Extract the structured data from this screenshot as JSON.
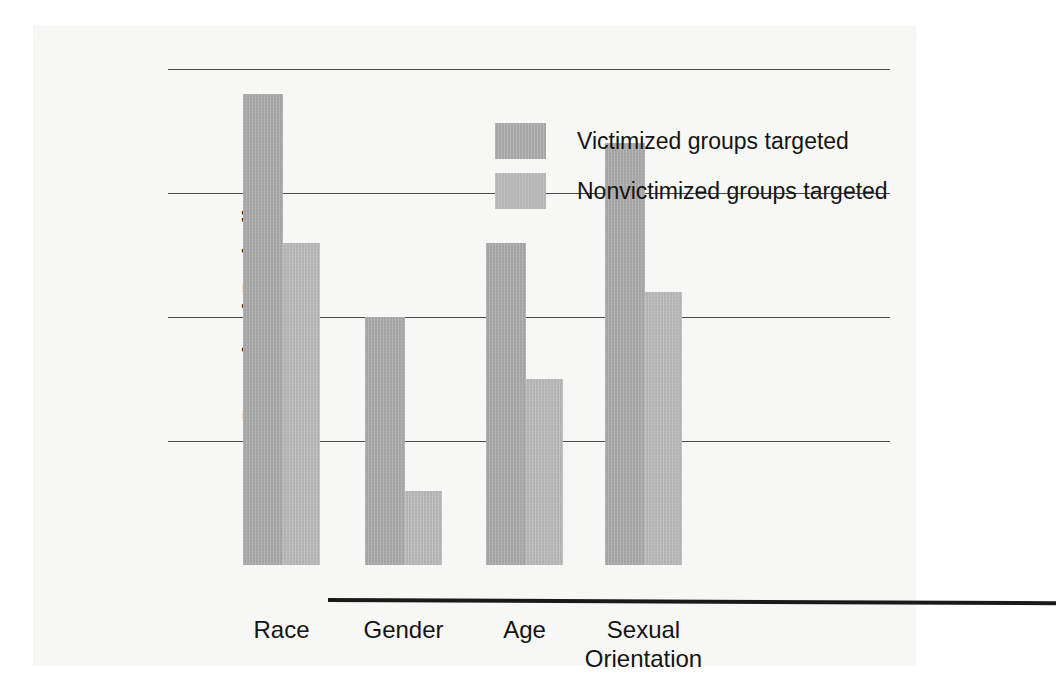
{
  "chart_data": {
    "type": "bar",
    "title": "",
    "xlabel": "",
    "ylabel": "Perceived Prejudice",
    "categories": [
      "Race",
      "Gender",
      "Age",
      "Sexual Orientation"
    ],
    "category_lines": [
      [
        "Race"
      ],
      [
        "Gender"
      ],
      [
        "Age"
      ],
      [
        "Sexual",
        "Orientation"
      ]
    ],
    "series": [
      {
        "name": "Victimized groups targeted",
        "color": "#a7a7a7",
        "values": [
          6.8,
          5.0,
          5.6,
          6.4
        ]
      },
      {
        "name": "Nonvictimized groups targeted",
        "color": "#b6b6b6",
        "values": [
          5.6,
          3.6,
          4.5,
          5.2
        ]
      }
    ],
    "yticks": [
      7,
      6,
      5,
      4
    ],
    "ylim": [
      3.0,
      7.2
    ],
    "baseline_value": 3.0,
    "grid": "horizontal",
    "legend_position": "inside-top-center"
  },
  "axis": {
    "ytick_labels": [
      "7",
      "6",
      "5",
      "4"
    ],
    "y_title": "Perceived Prejudice"
  },
  "legend": {
    "items": [
      {
        "label": "Victimized groups targeted"
      },
      {
        "label": "Nonvictimized groups targeted"
      }
    ]
  },
  "colors": {
    "series_victimized": "#a7a7a7",
    "series_nonvictimized": "#b6b6b6",
    "gridline": "#4a4a4a",
    "axis": "#1a1a1a",
    "text": "#141414",
    "page": "#f7f7f6"
  }
}
